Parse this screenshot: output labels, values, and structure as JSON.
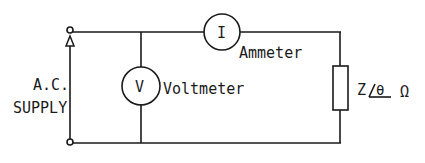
{
  "diagram": {
    "type": "circuit",
    "source": {
      "label_line1": "A.C.",
      "label_line2": "SUPPLY"
    },
    "voltmeter": {
      "symbol": "V",
      "label": "Voltmeter"
    },
    "ammeter": {
      "symbol": "I",
      "label": "Ammeter"
    },
    "load": {
      "label_prefix": "Z",
      "angle_symbol": "θ",
      "unit": "Ω"
    },
    "colors": {
      "line": "#1a1a1a",
      "background": "#ffffff"
    }
  }
}
